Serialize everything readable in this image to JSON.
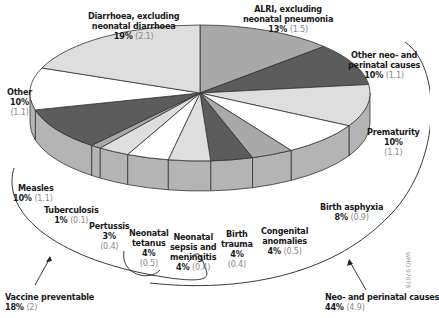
{
  "chart_data": {
    "type": "pie",
    "style": "3d-exploded-none",
    "title": "",
    "start": "top",
    "direction": "clockwise",
    "slices": [
      {
        "label": "ALRI, excluding neonatal pneumonia",
        "percent": 13,
        "value": 1.5,
        "shade": "#a9a9a9"
      },
      {
        "label": "Other neo- and perinatal causes",
        "percent": 10,
        "value": 1.1,
        "shade": "#5c5c5c"
      },
      {
        "label": "Prematurity",
        "percent": 10,
        "value": 1.1,
        "shade": "#dedede"
      },
      {
        "label": "Birth asphyxia",
        "percent": 8,
        "value": 0.9,
        "shade": "#ffffff"
      },
      {
        "label": "Congenital anomalies",
        "percent": 4,
        "value": 0.5,
        "shade": "#a9a9a9"
      },
      {
        "label": "Birth trauma",
        "percent": 4,
        "value": 0.4,
        "shade": "#5c5c5c"
      },
      {
        "label": "Neonatal sepsis and meningitis",
        "percent": 4,
        "value": 0.4,
        "shade": "#dedede"
      },
      {
        "label": "Neonatal tetanus",
        "percent": 4,
        "value": 0.5,
        "shade": "#ffffff"
      },
      {
        "label": "Pertussis",
        "percent": 3,
        "value": 0.4,
        "shade": "#dedede"
      },
      {
        "label": "Tuberculosis",
        "percent": 1,
        "value": 0.1,
        "shade": "#a9a9a9"
      },
      {
        "label": "Measles",
        "percent": 10,
        "value": 1.1,
        "shade": "#5c5c5c"
      },
      {
        "label": "Other",
        "percent": 10,
        "value": 1.1,
        "shade": "#ffffff"
      },
      {
        "label": "Diarrhoea, excluding neonatal diarrhoea",
        "percent": 19,
        "value": 2.1,
        "shade": "#dedede"
      }
    ],
    "groups": [
      {
        "label": "Vaccine preventable",
        "percent": 18,
        "value": 2,
        "members": [
          "Measles",
          "Tuberculosis",
          "Pertussis",
          "Neonatal tetanus"
        ]
      },
      {
        "label": "Neo- and perinatal causes",
        "percent": 44,
        "value": 4.9,
        "members": [
          "Other neo- and perinatal causes",
          "Prematurity",
          "Birth asphyxia",
          "Congenital anomalies",
          "Birth trauma",
          "Neonatal sepsis and meningitis",
          "Neonatal tetanus"
        ]
      }
    ],
    "side_color": "#b4b4b4",
    "outline_color": "#333333"
  },
  "labels": {
    "diarrhoea": {
      "l1": "Diarrhoea, excluding",
      "l2": "neonatal diarrhoea",
      "pct": "19%",
      "val": "(2.1)"
    },
    "alri": {
      "l1": "ALRI, excluding",
      "l2": "neonatal pneumonia",
      "pct": "13%",
      "val": "(1.5)"
    },
    "other_neo": {
      "l1": "Other neo- and",
      "l2": "perinatal causes",
      "pct": "10%",
      "val": "(1.1)"
    },
    "prematurity": {
      "l1": "Prematurity",
      "pct": "10%",
      "val": "(1.1)"
    },
    "birth_asphyxia": {
      "l1": "Birth asphyxia",
      "pct": "8%",
      "val": "(0.9)"
    },
    "congenital": {
      "l1": "Congenital",
      "l2": "anomalies",
      "pct": "4%",
      "val": "(0.5)"
    },
    "birth_trauma": {
      "l1": "Birth",
      "l2": "trauma",
      "pct": "4%",
      "val": "(0.4)"
    },
    "sepsis": {
      "l1": "Neonatal",
      "l2": "sepsis and",
      "l3": "meningitis",
      "pct": "4%",
      "val": "(0.4)"
    },
    "tetanus": {
      "l1": "Neonatal",
      "l2": "tetanus",
      "pct": "4%",
      "val": "(0.5)"
    },
    "pertussis": {
      "l1": "Pertussis",
      "pct": "3%",
      "val": "(0.4)"
    },
    "tuberculosis": {
      "l1": "Tuberculosis",
      "pct": "1%",
      "val": "(0.1)"
    },
    "measles": {
      "l1": "Measles",
      "pct": "10%",
      "val": "(1.1)"
    },
    "other": {
      "l1": "Other",
      "pct": "10%",
      "val": "(1.1)"
    },
    "vaccine": {
      "l1": "Vaccine preventable",
      "pct": "18%",
      "val": "(2)"
    },
    "neo_group": {
      "l1": "Neo- and perinatal causes",
      "pct": "44%",
      "val": "(4.9)"
    }
  },
  "figure_code": "WHO 97078"
}
